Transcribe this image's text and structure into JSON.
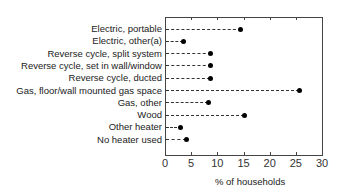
{
  "chart_data": {
    "type": "scatter",
    "subtype": "dot-plot-horizontal",
    "title": "",
    "xlabel": "% of households",
    "ylabel": "",
    "xlim": [
      0,
      30
    ],
    "xticks": [
      "0",
      "5",
      "10",
      "15",
      "20",
      "25",
      "30"
    ],
    "grid": false,
    "legend": null,
    "categories": [
      "Electric, portable",
      "Electric, other(a)",
      "Reverse cycle, split system",
      "Reverse cycle, set in wall/window",
      "Reverse cycle, ducted",
      "Gas, floor/wall mounted gas space",
      "Gas, other",
      "Wood",
      "Other heater",
      "No heater used"
    ],
    "values": [
      14.4,
      3.5,
      8.7,
      8.7,
      8.6,
      25.5,
      8.2,
      15.0,
      3.0,
      4.0
    ]
  }
}
